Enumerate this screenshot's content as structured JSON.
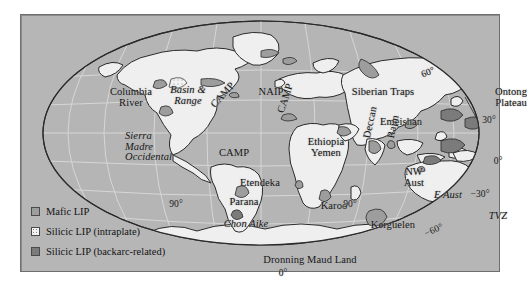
{
  "figure": {
    "kind": "world-map",
    "projection": "Mollweide-like oval"
  },
  "colors": {
    "ocean": "#b6b6b6",
    "land": "#efefef",
    "mafic_lip": "#9d9d9d",
    "silicic_intraplate": "#f2f2f2",
    "silicic_backarc": "#7b7b7b",
    "graticule": "#d8d8d8",
    "coastline": "#2a2a2a",
    "frame": "#6f6f6f",
    "text": "#171717"
  },
  "legend": {
    "items": [
      {
        "label": "Mafic LIP",
        "swatch": "mafic"
      },
      {
        "label": "Silicic LIP (intraplate)",
        "swatch": "intra"
      },
      {
        "label": "Silicic LIP (backarc-related)",
        "swatch": "backarc"
      }
    ]
  },
  "graticule_labels": [
    {
      "id": "lat-60-n",
      "text": "60°",
      "x": 406,
      "y": 56,
      "italic": false,
      "rotate": -22
    },
    {
      "id": "lat-30-n",
      "text": "30°",
      "x": 468,
      "y": 101,
      "italic": false,
      "rotate": 0
    },
    {
      "id": "lat-0-e",
      "text": "0°",
      "x": 477,
      "y": 142,
      "italic": false,
      "rotate": 0
    },
    {
      "id": "lat-30-s",
      "text": "−30°",
      "x": 459,
      "y": 175,
      "italic": false,
      "rotate": 0
    },
    {
      "id": "lat-60-s",
      "text": "−60°",
      "x": 412,
      "y": 215,
      "italic": false,
      "rotate": -24
    },
    {
      "id": "lon-90-w",
      "text": "90°",
      "x": 155,
      "y": 185,
      "italic": false,
      "rotate": 0
    },
    {
      "id": "lon-90-e",
      "text": "90°",
      "x": 329,
      "y": 185,
      "italic": false,
      "rotate": 0
    },
    {
      "id": "lon-0-bottom",
      "text": "0°",
      "x": 262,
      "y": 254,
      "italic": false,
      "rotate": 0
    }
  ],
  "province_labels": [
    {
      "id": "columbia-river",
      "text": "Columbia\nRiver",
      "x": 110,
      "y": 72,
      "italic": false,
      "rotate": 0,
      "align": "center"
    },
    {
      "id": "basin-and-range",
      "text": "Basin &\nRange",
      "x": 167,
      "y": 70,
      "italic": true,
      "rotate": 0,
      "align": "center"
    },
    {
      "id": "sierra-madre",
      "text": "Sierra\nMadre\nOccidental",
      "x": 104,
      "y": 116,
      "italic": true,
      "rotate": 0,
      "align": "left"
    },
    {
      "id": "camp-north",
      "text": "CAMP",
      "x": 188,
      "y": 88,
      "italic": false,
      "rotate": -48,
      "align": "left"
    },
    {
      "id": "camp-mid",
      "text": "CAMP",
      "x": 255,
      "y": 96,
      "italic": false,
      "rotate": -72,
      "align": "left"
    },
    {
      "id": "camp-south",
      "text": "CAMP",
      "x": 198,
      "y": 133,
      "italic": false,
      "rotate": 0,
      "align": "left"
    },
    {
      "id": "naip",
      "text": "NAIP",
      "x": 250,
      "y": 72,
      "italic": false,
      "rotate": 0,
      "align": "center"
    },
    {
      "id": "siberian-traps",
      "text": "Siberian Traps",
      "x": 362,
      "y": 72,
      "italic": false,
      "rotate": 0,
      "align": "center"
    },
    {
      "id": "emeishan",
      "text": "Emeishan",
      "x": 380,
      "y": 102,
      "italic": false,
      "rotate": 0,
      "align": "center"
    },
    {
      "id": "ontong-plateau",
      "text": "Ontong\nPlateau",
      "x": 490,
      "y": 72,
      "italic": false,
      "rotate": 0,
      "align": "center"
    },
    {
      "id": "ethiopia-yemen",
      "text": "Ethiopia\nYemen",
      "x": 305,
      "y": 122,
      "italic": false,
      "rotate": 0,
      "align": "center"
    },
    {
      "id": "deccan",
      "text": "Deccan",
      "x": 341,
      "y": 122,
      "italic": false,
      "rotate": -78,
      "align": "left"
    },
    {
      "id": "rajmahal",
      "text": "Rajm",
      "x": 365,
      "y": 122,
      "italic": false,
      "rotate": -78,
      "align": "left"
    },
    {
      "id": "etendeka",
      "text": "Etendeka",
      "x": 239,
      "y": 163,
      "italic": false,
      "rotate": 0,
      "align": "center"
    },
    {
      "id": "parana",
      "text": "Parana",
      "x": 223,
      "y": 182,
      "italic": false,
      "rotate": 0,
      "align": "center"
    },
    {
      "id": "chon-aike",
      "text": "Chon Aike",
      "x": 225,
      "y": 204,
      "italic": true,
      "rotate": 0,
      "align": "center"
    },
    {
      "id": "karoo",
      "text": "Karoo",
      "x": 313,
      "y": 186,
      "italic": false,
      "rotate": 0,
      "align": "center"
    },
    {
      "id": "kerguelen",
      "text": "Kerguelen",
      "x": 372,
      "y": 205,
      "italic": false,
      "rotate": 0,
      "align": "center"
    },
    {
      "id": "dronning-maud-land",
      "text": "Dronning Maud Land",
      "x": 289,
      "y": 240,
      "italic": false,
      "rotate": 0,
      "align": "center"
    },
    {
      "id": "nw-aust",
      "text": "NW\nAust",
      "x": 393,
      "y": 152,
      "italic": false,
      "rotate": 0,
      "align": "center"
    },
    {
      "id": "e-aust",
      "text": "E Aust",
      "x": 427,
      "y": 175,
      "italic": true,
      "rotate": 0,
      "align": "center"
    },
    {
      "id": "tvz",
      "text": "TVZ",
      "x": 477,
      "y": 196,
      "italic": true,
      "rotate": 0,
      "align": "center"
    }
  ]
}
